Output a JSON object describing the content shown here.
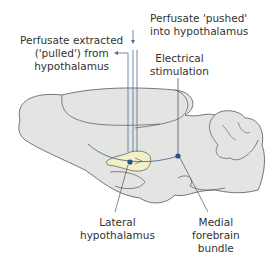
{
  "labels": {
    "pushed": [
      "Perfusate 'pushed'",
      "into hypothalamus"
    ],
    "pulled": [
      "Perfusate extracted",
      "('pulled') from",
      "hypothalamus"
    ],
    "electrical": [
      "Electrical",
      "stimulation"
    ],
    "lateral": [
      "Lateral",
      "hypothalamus"
    ],
    "medial": [
      "Medial",
      "forebrain",
      "bundle"
    ]
  },
  "colors": {
    "brain_fill": "#e4e4e2",
    "outline": "#555555",
    "probe": "#4a6c9a",
    "hypothalamus_fill": "#f3efc8",
    "dot": "#2b4f8c"
  }
}
